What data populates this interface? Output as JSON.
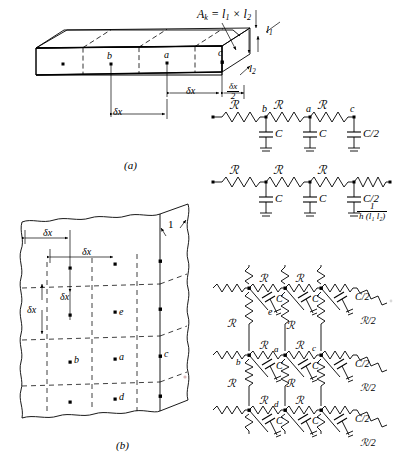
{
  "figure": {
    "panels": [
      {
        "id": "a",
        "label": "(a)",
        "caption": "One-dimensional wall subdivided into cells"
      },
      {
        "id": "b",
        "label": "(b)",
        "caption": "Two-dimensional body subdivided into cells"
      }
    ]
  },
  "panel_a": {
    "area_formula": "A",
    "area_formula_sub": "k",
    "area_formula_rest": " = l",
    "area_formula_sub2": "1",
    "area_formula_times": " × l",
    "area_formula_sub3": "2",
    "edge_labels": {
      "l1": "l",
      "l1_sub": "1",
      "l2": "l",
      "l2_sub": "2"
    },
    "node_labels": [
      "b",
      "a",
      "c"
    ],
    "dimensions": [
      {
        "name": "delta-x-full",
        "text": "δx"
      },
      {
        "name": "delta-x-inner",
        "text": "δx"
      },
      {
        "name": "delta-x-half-num",
        "text": "δx"
      },
      {
        "name": "delta-x-half-den",
        "text": "2"
      }
    ]
  },
  "circuit_1": {
    "name": "insulated-boundary-ladder",
    "resistors": [
      "ℛ",
      "ℛ",
      "ℛ"
    ],
    "nodes": [
      "b",
      "a",
      "c"
    ],
    "capacitors": [
      "C",
      "C",
      "C/2"
    ]
  },
  "circuit_2": {
    "name": "convective-boundary-ladder",
    "resistors": [
      "ℛ",
      "ℛ",
      "ℛ"
    ],
    "nodes": [
      "",
      "",
      ""
    ],
    "capacitors": [
      "C",
      "C",
      "C/2"
    ],
    "terminal_resistance": {
      "numerator": "1",
      "denominator": "h (l₁ l₂)"
    }
  },
  "panel_b": {
    "thickness_label": "1",
    "node_labels": [
      "b",
      "a",
      "c",
      "d",
      "e"
    ],
    "dimensions": [
      {
        "name": "delta-x-top-outer",
        "text": "δx"
      },
      {
        "name": "delta-x-top-inner",
        "text": "δx"
      },
      {
        "name": "delta-x-vert-inner",
        "text": "δx"
      },
      {
        "name": "delta-x-vert-outer",
        "text": "δx"
      }
    ]
  },
  "circuit_3": {
    "name": "two-dimensional-rc-network",
    "resistor_label": "ℛ",
    "half_resistor_label": "ℛ/2",
    "capacitor_label": "C",
    "half_capacitor_label": "C/2",
    "nodes": [
      "e",
      "b",
      "a",
      "c",
      "d"
    ],
    "row1": {
      "resistors": [
        "ℛ",
        "ℛ"
      ],
      "caps": [
        "C",
        "C",
        "C/2"
      ],
      "edge_res": "ℛ/2"
    },
    "row2": {
      "resistors": [
        "ℛ",
        "ℛ"
      ],
      "caps": [
        "C",
        "C",
        "C/2"
      ],
      "edge_res": "ℛ/2"
    },
    "row3": {
      "resistors": [
        "ℛ",
        "ℛ"
      ],
      "caps": [
        "C",
        "C",
        "C/2"
      ],
      "edge_res": "ℛ/2"
    },
    "vertical_resistors": [
      "ℛ",
      "ℛ",
      "ℛ",
      "ℛ"
    ]
  }
}
